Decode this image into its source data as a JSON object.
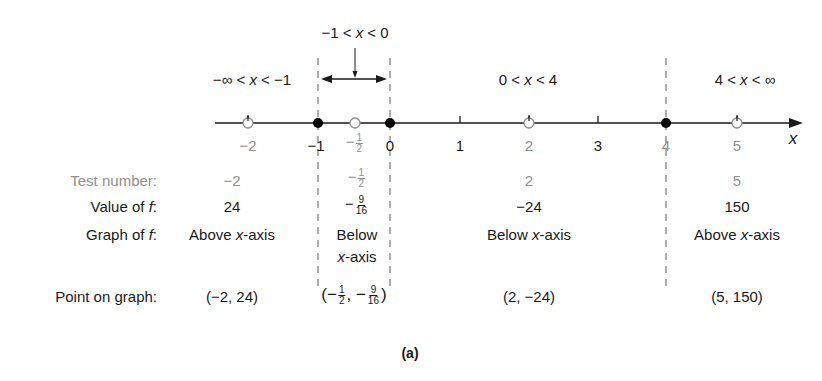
{
  "figure": {
    "caption": "(a)",
    "axis_label": "x",
    "intervals": [
      {
        "label_pre": "−∞ < ",
        "label_var": "x",
        "label_post": " < −1"
      },
      {
        "label_pre": "−1 < ",
        "label_var": "x",
        "label_post": " < 0"
      },
      {
        "label_pre": "0 < ",
        "label_var": "x",
        "label_post": " < 4"
      },
      {
        "label_pre": "4 < ",
        "label_var": "x",
        "label_post": " < ∞"
      }
    ],
    "ticks": [
      {
        "label": "−2",
        "muted": true
      },
      {
        "label": "−1",
        "muted": false
      },
      {
        "label_sign": "−",
        "num": "1",
        "den": "2",
        "muted": true
      },
      {
        "label": "0",
        "muted": false
      },
      {
        "label": "1",
        "muted": false
      },
      {
        "label": "2",
        "muted": true
      },
      {
        "label": "3",
        "muted": false
      },
      {
        "label": "4",
        "muted": true
      },
      {
        "label": "5",
        "muted": true
      }
    ],
    "zeros": [
      "-1",
      "0",
      "4"
    ],
    "test_points": [
      "-2",
      "-1/2",
      "2",
      "5"
    ],
    "row_labels": {
      "test_number": "Test number:",
      "value_of_f_pre": "Value of ",
      "value_of_f_var": "f",
      "value_of_f_post": ":",
      "graph_of_f_pre": "Graph of ",
      "graph_of_f_var": "f",
      "graph_of_f_post": ":",
      "point_on_graph": "Point on graph:"
    },
    "columns": [
      {
        "test_number": "−2",
        "value": "24",
        "graph_pre": "Above ",
        "graph_var": "x",
        "graph_post": "-axis",
        "point": "(−2, 24)"
      },
      {
        "test_sign": "−",
        "test_num": "1",
        "test_den": "2",
        "value_sign": "−",
        "value_num": "9",
        "value_den": "16",
        "graph_line1": "Below",
        "graph_line2_var": "x",
        "graph_line2_post": "-axis",
        "point_open": "(−",
        "point_x_num": "1",
        "point_x_den": "2",
        "point_mid": ", −",
        "point_y_num": "9",
        "point_y_den": "16",
        "point_close": ")"
      },
      {
        "test_number": "2",
        "value": "−24",
        "graph_pre": "Below ",
        "graph_var": "x",
        "graph_post": "-axis",
        "point": "(2, −24)"
      },
      {
        "test_number": "5",
        "value": "150",
        "graph_pre": "Above ",
        "graph_var": "x",
        "graph_post": "-axis",
        "point": "(5, 150)"
      }
    ]
  },
  "colors": {
    "ink": "#1a1a1a",
    "muted": "#8f8f8f",
    "dash": "#7a7a7a"
  }
}
